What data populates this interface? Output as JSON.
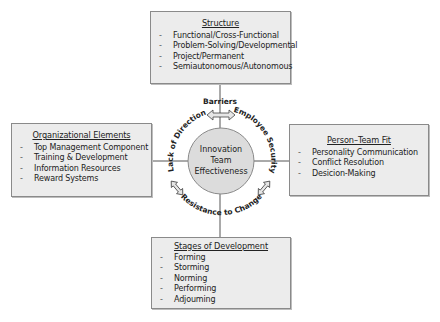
{
  "center": {
    "lines": [
      "Innovation",
      "Team",
      "Effectiveness"
    ],
    "fill": "#dcdcdc",
    "stroke": "#8a8a8a"
  },
  "barriers": {
    "top": "Barriers",
    "left": "Lack of Direction",
    "right": "Employee Security",
    "bottom": "Resistance to Change"
  },
  "boxes": {
    "structure": {
      "title": "Structure",
      "items": [
        "Functional/Cross-Functional",
        "Problem-Solving/Developmental",
        "Project/Permanent",
        "Semiautonomous/Autonomous"
      ]
    },
    "organizational": {
      "title": "Organizational Elements",
      "items": [
        "Top Management Component",
        "Training & Development",
        "Information Resources",
        "Reward Systems"
      ]
    },
    "person_team": {
      "title": "Person–Team Fit",
      "items": [
        "Personality Communication",
        "Conflict Resolution",
        "Desicion-Making"
      ]
    },
    "stages": {
      "title": "Stages of Development",
      "items": [
        "Forming",
        "Storming",
        "Norming",
        "Performing",
        "Adjouming"
      ]
    }
  },
  "bullet": "-",
  "colors": {
    "box_fill": "#ececec",
    "box_border": "#8a8a8a",
    "line": "#555555",
    "arrow_fill": "#e6e6e6"
  }
}
